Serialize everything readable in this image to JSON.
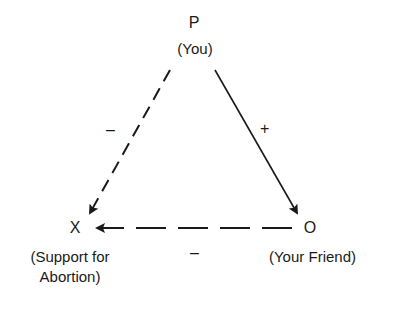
{
  "diagram": {
    "type": "balance-theory-triangle",
    "nodes": {
      "p": {
        "letter": "P",
        "caption": "(You)"
      },
      "x": {
        "letter": "X",
        "caption_line1": "(Support for",
        "caption_line2": "Abortion)"
      },
      "o": {
        "letter": "O",
        "caption": "(Your Friend)"
      }
    },
    "edges": [
      {
        "from": "P",
        "to": "X",
        "style": "dashed",
        "sign": "–"
      },
      {
        "from": "P",
        "to": "O",
        "style": "solid",
        "sign": "+"
      },
      {
        "from": "O",
        "to": "X",
        "style": "dashed",
        "sign": "–"
      }
    ],
    "colors": {
      "ink": "#1a1a1a",
      "background": "#ffffff"
    }
  }
}
